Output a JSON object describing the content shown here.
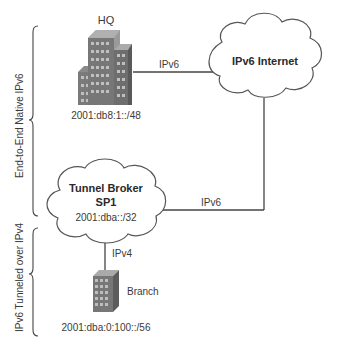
{
  "diagram": {
    "nodes": {
      "hq": {
        "label": "HQ",
        "prefix": "2001:db8:1::/48",
        "icon": "office-building-icon"
      },
      "internet": {
        "label": "IPv6 Internet",
        "icon": "cloud-icon"
      },
      "broker": {
        "label_line1": "Tunnel Broker",
        "label_line2": "SP1",
        "prefix": "2001:dba::/32",
        "icon": "cloud-icon"
      },
      "branch": {
        "label": "Branch",
        "prefix": "2001:dba:0:100::/56",
        "icon": "small-building-icon"
      }
    },
    "links": {
      "hq_internet": "IPv6",
      "broker_internet": "IPv6",
      "broker_branch": "IPv4"
    },
    "brackets": {
      "top": "End-to-End Native IPv6",
      "bottom": "IPv6 Tunneled over IPv4"
    },
    "colors": {
      "line": "#444444",
      "building_dark": "#6e6e6e",
      "building_light": "#9a9a9a",
      "window": "#c4c4c4"
    }
  }
}
